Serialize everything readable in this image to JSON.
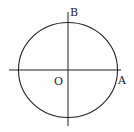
{
  "diagram": {
    "labels": {
      "origin": "O",
      "point_a": "A",
      "point_b": "B"
    },
    "colors": {
      "stroke": "#222222",
      "background": "#fdfdfd"
    }
  }
}
